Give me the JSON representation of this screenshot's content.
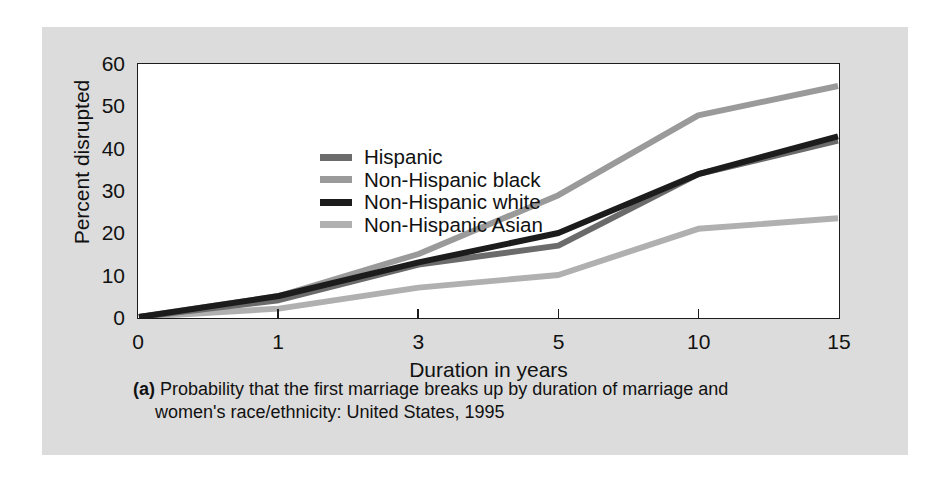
{
  "chart_data": {
    "type": "line",
    "title": "",
    "xlabel": "Duration in years",
    "ylabel": "Percent disrupted",
    "categories": [
      "0",
      "1",
      "3",
      "5",
      "10",
      "15"
    ],
    "x_tick_labels": [
      "0",
      "1",
      "3",
      "5",
      "10",
      "15"
    ],
    "y_tick_labels": [
      "0",
      "10",
      "20",
      "30",
      "40",
      "50",
      "60"
    ],
    "ylim": [
      0,
      60
    ],
    "y_step": 10,
    "grid": false,
    "legend_position": "top-left inside plot",
    "markers": false,
    "x_spacing": "ordinal (even spacing between category ticks)",
    "series": [
      {
        "name": "Hispanic",
        "color": "#6b6b6b",
        "line_width": 6,
        "values": [
          0,
          4,
          12.5,
          17,
          34,
          42
        ]
      },
      {
        "name": "Non-Hispanic black",
        "color": "#9a9a9a",
        "line_width": 6,
        "values": [
          0,
          5,
          15,
          29,
          48,
          55
        ]
      },
      {
        "name": "Non-Hispanic white",
        "color": "#1c1c1c",
        "line_width": 6,
        "values": [
          0,
          5,
          13,
          20,
          34,
          43
        ]
      },
      {
        "name": "Non-Hispanic Asian",
        "color": "#b0b0b0",
        "line_width": 6,
        "values": [
          0,
          2,
          7,
          10,
          21,
          23.5
        ]
      }
    ]
  },
  "legend": {
    "entries": [
      {
        "label": "Hispanic",
        "color": "#6b6b6b"
      },
      {
        "label": "Non-Hispanic black",
        "color": "#9a9a9a"
      },
      {
        "label": "Non-Hispanic white",
        "color": "#1c1c1c"
      },
      {
        "label": "Non-Hispanic Asian",
        "color": "#b0b0b0"
      }
    ]
  },
  "caption": {
    "tag": "(a)",
    "line1": "Probability that the first marriage breaks up by duration of marriage and",
    "line2": "women's race/ethnicity: United States, 1995"
  },
  "colors": {
    "panel_background": "#dcdcdc",
    "plot_background": "#ffffff",
    "axis": "#1c1c1c",
    "text": "#111111",
    "page_background": "#ffffff"
  }
}
